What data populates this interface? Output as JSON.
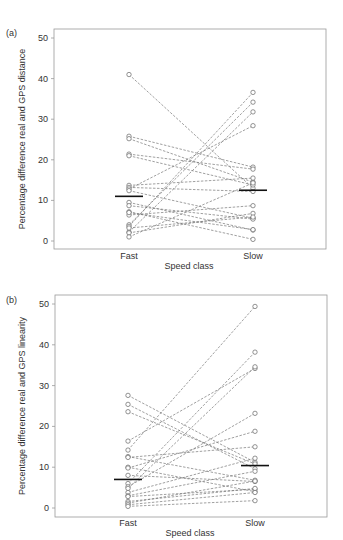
{
  "chart_data": [
    {
      "type": "scatter",
      "panel_label": "(a)",
      "title": "",
      "xlabel": "Speed class",
      "ylabel": "Percentage difference real and GPS distance",
      "categories": [
        "Fast",
        "Slow"
      ],
      "yticks": [
        0,
        10,
        20,
        30,
        40,
        50
      ],
      "ylim": [
        -1.5,
        52
      ],
      "grid": false,
      "style": "paired points connected by dashed lines; horizontal bar = median",
      "medians": {
        "Fast": 11.0,
        "Slow": 12.5
      },
      "pairs": [
        [
          41.0,
          13.0
        ],
        [
          25.8,
          18.2
        ],
        [
          25.2,
          14.5
        ],
        [
          21.4,
          17.7
        ],
        [
          21.0,
          13.8
        ],
        [
          13.7,
          15.5
        ],
        [
          13.2,
          12.2
        ],
        [
          12.8,
          28.4
        ],
        [
          12.4,
          5.6
        ],
        [
          9.5,
          2.7
        ],
        [
          8.7,
          5.4
        ],
        [
          7.2,
          0.4
        ],
        [
          6.4,
          8.7
        ],
        [
          4.0,
          34.2
        ],
        [
          3.6,
          36.6
        ],
        [
          2.2,
          31.8
        ],
        [
          2.0,
          6.8
        ],
        [
          1.0,
          14.3
        ],
        [
          3.2,
          5.9
        ],
        [
          7.0,
          2.8
        ]
      ]
    },
    {
      "type": "scatter",
      "panel_label": "(b)",
      "title": "",
      "xlabel": "Speed class",
      "ylabel": "Percentage difference real and GPS linearity",
      "categories": [
        "Fast",
        "Slow"
      ],
      "yticks": [
        0,
        10,
        20,
        30,
        40,
        50
      ],
      "ylim": [
        -1.5,
        52
      ],
      "grid": false,
      "style": "paired points connected by dashed lines; horizontal bar = median",
      "medians": {
        "Fast": 7.0,
        "Slow": 10.4
      },
      "pairs": [
        [
          27.6,
          11.2
        ],
        [
          25.4,
          9.6
        ],
        [
          23.6,
          10.8
        ],
        [
          16.4,
          34.2
        ],
        [
          14.2,
          49.4
        ],
        [
          12.6,
          6.8
        ],
        [
          12.4,
          15.0
        ],
        [
          10.0,
          4.0
        ],
        [
          9.8,
          18.8
        ],
        [
          8.0,
          6.5
        ],
        [
          6.0,
          38.2
        ],
        [
          5.2,
          23.2
        ],
        [
          4.8,
          34.6
        ],
        [
          3.8,
          12.2
        ],
        [
          3.0,
          9.0
        ],
        [
          2.8,
          4.6
        ],
        [
          1.6,
          4.8
        ],
        [
          1.2,
          6.6
        ],
        [
          0.8,
          3.8
        ],
        [
          0.4,
          1.8
        ]
      ]
    }
  ],
  "charts": [
    {
      "panel": "(a)",
      "ylabel": "Percentage difference real and GPS distance",
      "xlabel": "Speed class",
      "cat_fast": "Fast",
      "cat_slow": "Slow"
    },
    {
      "panel": "(b)",
      "ylabel": "Percentage difference real and GPS linearity",
      "xlabel": "Speed class",
      "cat_fast": "Fast",
      "cat_slow": "Slow"
    }
  ]
}
